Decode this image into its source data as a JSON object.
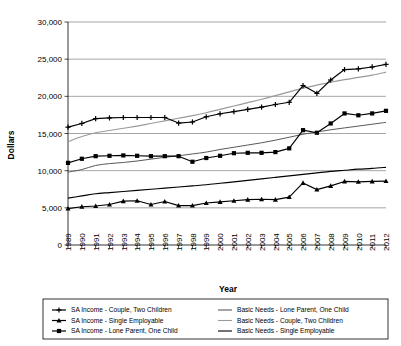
{
  "chart_data": {
    "type": "line",
    "title": "",
    "xlabel": "Year",
    "ylabel": "Dollars",
    "ylim": [
      0,
      30000
    ],
    "ytick_labels": [
      "0",
      "5,000",
      "10,000",
      "15,000",
      "20,000",
      "25,000",
      "30,000"
    ],
    "ytick_values": [
      0,
      5000,
      10000,
      15000,
      20000,
      25000,
      30000
    ],
    "grid": true,
    "legend_position": "bottom",
    "categories": [
      "1989",
      "1990",
      "1991",
      "1992",
      "1993",
      "1994",
      "1995",
      "1996",
      "1997",
      "1998",
      "1999",
      "2000",
      "2001",
      "2002",
      "2003",
      "2004",
      "2005",
      "2006",
      "2007",
      "2008",
      "2009",
      "2010",
      "2011",
      "2012"
    ],
    "series": [
      {
        "name": "SA Income - Couple, Two Children",
        "marker": "plus",
        "color": "#000000",
        "style": "solid-marker",
        "values": [
          15850,
          16350,
          17000,
          17100,
          17150,
          17150,
          17150,
          17150,
          16400,
          16550,
          17250,
          17650,
          17950,
          18250,
          18550,
          18900,
          19200,
          21450,
          20400,
          22200,
          23600,
          23700,
          23950,
          24300
        ]
      },
      {
        "name": "SA Income - Single Employable",
        "marker": "triangle",
        "color": "#000000",
        "style": "solid-marker",
        "values": [
          4900,
          5150,
          5250,
          5450,
          5900,
          5950,
          5450,
          5850,
          5300,
          5300,
          5650,
          5800,
          5950,
          6100,
          6150,
          6100,
          6450,
          8350,
          7450,
          7950,
          8550,
          8500,
          8550,
          8600
        ]
      },
      {
        "name": "SA Income - Lone Parent, One Child",
        "marker": "square",
        "color": "#000000",
        "style": "solid-marker",
        "values": [
          11050,
          11600,
          11950,
          12000,
          12050,
          12000,
          11950,
          11950,
          11950,
          11200,
          11700,
          12000,
          12350,
          12400,
          12400,
          12500,
          13000,
          15450,
          15100,
          16350,
          17700,
          17450,
          17700,
          18050
        ]
      },
      {
        "name": "Basic Needs - Lone Parent, One Child",
        "marker": "none",
        "color": "#595959",
        "style": "solid",
        "values": [
          9800,
          10150,
          10700,
          10950,
          11100,
          11300,
          11550,
          11800,
          12000,
          12250,
          12500,
          12850,
          13150,
          13450,
          13750,
          14100,
          14500,
          14900,
          15200,
          15500,
          15750,
          16000,
          16250,
          16500
        ]
      },
      {
        "name": "Basic Needs - Couple, Two Children",
        "marker": "none",
        "color": "#9a9a9a",
        "style": "solid",
        "values": [
          13900,
          14600,
          15100,
          15400,
          15700,
          16000,
          16350,
          16700,
          17050,
          17400,
          17800,
          18250,
          18700,
          19150,
          19600,
          20100,
          20600,
          21100,
          21500,
          21900,
          22250,
          22550,
          22850,
          23250
        ]
      },
      {
        "name": "Basic Needs - Single Employable",
        "marker": "none",
        "color": "#000000",
        "style": "solid",
        "values": [
          6300,
          6600,
          6900,
          7050,
          7200,
          7350,
          7500,
          7650,
          7800,
          7950,
          8100,
          8300,
          8500,
          8700,
          8900,
          9100,
          9300,
          9500,
          9700,
          9900,
          10050,
          10200,
          10300,
          10450
        ]
      }
    ],
    "legend": [
      {
        "label": "SA Income - Couple, Two Children",
        "marker": "plus",
        "color": "#000000"
      },
      {
        "label": "SA Income - Single Employable",
        "marker": "triangle",
        "color": "#000000"
      },
      {
        "label": "SA Income - Lone Parent, One Child",
        "marker": "square",
        "color": "#000000"
      },
      {
        "label": "Basic Needs - Lone Parent, One Child",
        "marker": "none",
        "color": "#595959"
      },
      {
        "label": "Basic Needs - Couple, Two Children",
        "marker": "none",
        "color": "#9a9a9a"
      },
      {
        "label": "Basic Needs - Single Employable",
        "marker": "none",
        "color": "#000000"
      }
    ]
  }
}
